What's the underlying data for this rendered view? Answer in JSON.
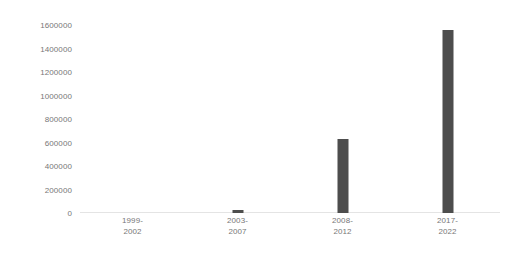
{
  "chart_data": {
    "type": "bar",
    "title": "",
    "subtitle": "",
    "xlabel": "",
    "ylabel": "",
    "categories": [
      "1999-\n2002",
      "2003-\n2007",
      "2008-\n2012",
      "2017-\n2022"
    ],
    "category_lines": [
      [
        "1999-",
        "2002"
      ],
      [
        "2003-",
        "2007"
      ],
      [
        "2008-",
        "2012"
      ],
      [
        "2017-",
        "2022"
      ]
    ],
    "values": [
      0,
      25000,
      580000,
      1430000
    ],
    "ylim": [
      0,
      1600000
    ],
    "ytick_values": [
      1600000,
      1400000,
      1200000,
      1000000,
      800000,
      600000,
      400000,
      200000,
      0
    ],
    "ytick_labels": [
      "1600000",
      "1400000",
      "1200000",
      "1000000",
      "800000",
      "600000",
      "400000",
      "200000",
      "0"
    ],
    "grid": false,
    "legend": null,
    "legend_position": "none",
    "bar_color": "#4d4d4d",
    "axis_label_color": "#777777",
    "baseline_color": "#e4e4e4",
    "background_color": "#ffffff"
  }
}
